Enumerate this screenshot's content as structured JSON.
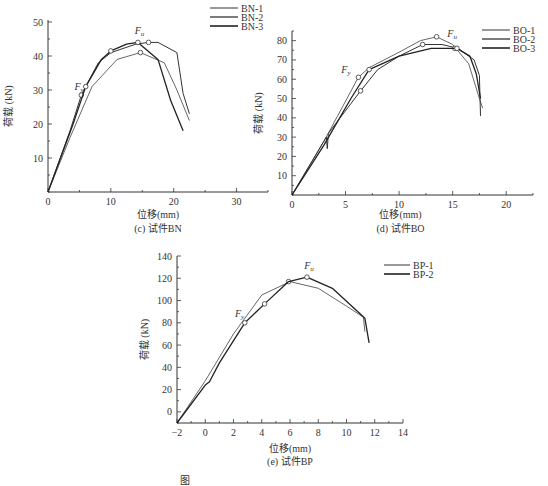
{
  "chart_data": [
    {
      "id": "bn",
      "type": "line",
      "caption": "(c) 试件BN",
      "xlabel": "位移(mm)",
      "ylabel": "荷载 (kN)",
      "xlim": [
        0,
        35
      ],
      "ylim": [
        0,
        50
      ],
      "xticks": [
        0,
        10,
        20,
        30
      ],
      "yticks": [
        10,
        20,
        30,
        40,
        50
      ],
      "grid": false,
      "legend_position": "top-right",
      "annotations": [
        {
          "text": "F",
          "sub": "y",
          "x": 4.2,
          "y": 30
        },
        {
          "text": "F",
          "sub": "u",
          "x": 13.8,
          "y": 46.5
        }
      ],
      "series": [
        {
          "name": "BN-1",
          "stroke": "#555555",
          "width": 0.9,
          "points": [
            [
              0,
              0
            ],
            [
              3.5,
              16
            ],
            [
              7,
              31
            ],
            [
              11,
              39
            ],
            [
              14.7,
              41
            ],
            [
              18.5,
              38
            ],
            [
              20.5,
              30
            ],
            [
              22.5,
              21
            ]
          ],
          "markers": [
            [
              14.7,
              41
            ]
          ]
        },
        {
          "name": "BN-2",
          "stroke": "#333333",
          "width": 1.0,
          "points": [
            [
              0,
              0
            ],
            [
              3.5,
              18
            ],
            [
              5.3,
              28.5
            ],
            [
              6,
              31
            ],
            [
              8,
              38
            ],
            [
              10,
              41
            ],
            [
              14,
              43.5
            ],
            [
              16,
              44
            ],
            [
              17.5,
              44
            ],
            [
              20.5,
              41
            ],
            [
              21.5,
              29
            ],
            [
              22.5,
              23
            ]
          ],
          "markers": [
            [
              5.3,
              28.5
            ],
            [
              16,
              44
            ]
          ]
        },
        {
          "name": "BN-3",
          "stroke": "#222222",
          "width": 1.3,
          "points": [
            [
              0,
              0
            ],
            [
              4,
              20
            ],
            [
              6,
              31
            ],
            [
              8.5,
              39
            ],
            [
              10,
              41.5
            ],
            [
              12.5,
              43.5
            ],
            [
              14.3,
              44
            ],
            [
              17.5,
              39
            ],
            [
              19.5,
              27
            ],
            [
              21.5,
              18
            ]
          ],
          "markers": [
            [
              6,
              31
            ],
            [
              10,
              41.5
            ],
            [
              14.3,
              44
            ]
          ]
        }
      ]
    },
    {
      "id": "bo",
      "type": "line",
      "caption": "(d) 试件BO",
      "xlabel": "位移(mm)",
      "ylabel": "荷载 (kN)",
      "xlim": [
        0,
        22.5
      ],
      "ylim": [
        0,
        85
      ],
      "xticks": [
        0,
        5,
        10,
        15,
        20
      ],
      "yticks": [
        10,
        20,
        30,
        40,
        50,
        60,
        70,
        80
      ],
      "grid": false,
      "legend_position": "top-right",
      "annotations": [
        {
          "text": "F",
          "sub": "y",
          "x": 4.6,
          "y": 63
        },
        {
          "text": "F",
          "sub": "u",
          "x": 14.5,
          "y": 82
        }
      ],
      "series": [
        {
          "name": "BO-1",
          "stroke": "#555555",
          "width": 0.9,
          "points": [
            [
              0,
              0
            ],
            [
              3,
              28
            ],
            [
              6.2,
              61
            ],
            [
              7.2,
              66
            ],
            [
              10,
              74
            ],
            [
              12,
              80
            ],
            [
              13.5,
              82
            ],
            [
              15,
              78
            ],
            [
              16.5,
              68
            ],
            [
              17.5,
              50
            ],
            [
              17.8,
              45
            ]
          ],
          "markers": [
            [
              6.2,
              61
            ],
            [
              13.5,
              82
            ]
          ]
        },
        {
          "name": "BO-2",
          "stroke": "#333333",
          "width": 1.0,
          "points": [
            [
              0,
              0
            ],
            [
              3.2,
              30
            ],
            [
              3.3,
              24
            ],
            [
              3.4,
              32
            ],
            [
              6.4,
              54
            ],
            [
              8,
              65
            ],
            [
              10,
              72
            ],
            [
              12.2,
              78
            ],
            [
              14,
              78
            ],
            [
              15.5,
              76
            ],
            [
              17,
              70
            ],
            [
              17.5,
              62
            ],
            [
              17.6,
              41
            ]
          ],
          "markers": [
            [
              6.4,
              54
            ],
            [
              12.2,
              78
            ],
            [
              15.2,
              76
            ]
          ]
        },
        {
          "name": "BO-3",
          "stroke": "#222222",
          "width": 1.3,
          "points": [
            [
              0,
              0
            ],
            [
              3,
              26
            ],
            [
              5.5,
              50
            ],
            [
              7.2,
              65
            ],
            [
              10,
              72
            ],
            [
              13,
              76
            ],
            [
              15.4,
              76
            ],
            [
              16.6,
              72
            ],
            [
              17.2,
              63
            ],
            [
              17.6,
              50
            ]
          ],
          "markers": [
            [
              7.2,
              65
            ],
            [
              15.4,
              76
            ]
          ]
        }
      ]
    },
    {
      "id": "bp",
      "type": "line",
      "caption": "(e) 试件BP",
      "xlabel": "位移(mm)",
      "ylabel": "荷载 (kN)",
      "xlim": [
        -2,
        14
      ],
      "ylim": [
        -10,
        140
      ],
      "xticks": [
        -2,
        0,
        2,
        4,
        6,
        8,
        10,
        12,
        14
      ],
      "yticks": [
        0,
        20,
        40,
        60,
        80,
        100,
        120,
        140
      ],
      "grid": false,
      "legend_position": "top-right",
      "annotations": [
        {
          "text": "F",
          "sub": "y",
          "x": 2.1,
          "y": 85
        },
        {
          "text": "F",
          "sub": "u",
          "x": 7.0,
          "y": 128
        }
      ],
      "series": [
        {
          "name": "BP-1",
          "stroke": "#555555",
          "width": 0.9,
          "points": [
            [
              -2,
              -10
            ],
            [
              0,
              28
            ],
            [
              2,
              70
            ],
            [
              4,
              105
            ],
            [
              6,
              117
            ],
            [
              8,
              111
            ],
            [
              10,
              95
            ],
            [
              11.2,
              85
            ],
            [
              11.3,
              72
            ]
          ],
          "markers": [
            [
              5.9,
              117
            ]
          ]
        },
        {
          "name": "BP-2",
          "stroke": "#222222",
          "width": 1.3,
          "points": [
            [
              -2,
              -10
            ],
            [
              0,
              24
            ],
            [
              0.3,
              27
            ],
            [
              1,
              44
            ],
            [
              2.8,
              80
            ],
            [
              4.2,
              97
            ],
            [
              5.9,
              117
            ],
            [
              7.2,
              121
            ],
            [
              9,
              111
            ],
            [
              11.3,
              84
            ],
            [
              11.6,
              62
            ]
          ],
          "markers": [
            [
              2.8,
              80
            ],
            [
              4.2,
              97
            ],
            [
              7.2,
              121
            ]
          ]
        }
      ]
    }
  ],
  "figure_caption": "图"
}
